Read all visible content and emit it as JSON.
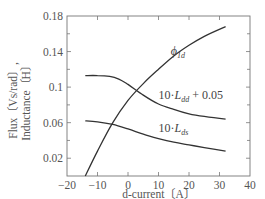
{
  "chart_data": {
    "type": "line",
    "title": "",
    "xlabel": "d-current〔A〕",
    "ylabel_lines": [
      "Flux〔Vs/rad〕,",
      "Inductance〔H〕"
    ],
    "xlim": [
      -20,
      40
    ],
    "ylim": [
      0,
      0.18
    ],
    "x_ticks": [
      -20,
      -10,
      0,
      10,
      20,
      30,
      40
    ],
    "x_tick_labels": [
      "−20",
      "−10",
      "0",
      "10",
      "20",
      "30",
      "40"
    ],
    "y_ticks": [
      0.02,
      0.06,
      0.1,
      0.14,
      0.18
    ],
    "y_tick_labels": [
      "0.02",
      "0.06",
      "0.1",
      "0.14",
      "0.18"
    ],
    "y_minor_ticks": [
      0.04,
      0.08,
      0.12,
      0.16
    ],
    "grid": false,
    "legend": "none (inline labels)",
    "series": [
      {
        "name": "phi_1d",
        "label_main": "ϕ",
        "label_sub": "1d",
        "x": [
          -14,
          -10,
          -5,
          0,
          5,
          10,
          15,
          20,
          25,
          32
        ],
        "y": [
          0.0,
          0.028,
          0.06,
          0.085,
          0.104,
          0.12,
          0.135,
          0.147,
          0.157,
          0.168
        ]
      },
      {
        "name": "10*L_dd+0.05",
        "label_prefix": "10·",
        "label_main": "L",
        "label_sub": "dd",
        "label_suffix": "+ 0.05",
        "x": [
          -14,
          -10,
          -6,
          -3,
          0,
          5,
          10,
          15,
          20,
          25,
          32
        ],
        "y": [
          0.113,
          0.113,
          0.112,
          0.109,
          0.103,
          0.091,
          0.081,
          0.075,
          0.07,
          0.067,
          0.064
        ]
      },
      {
        "name": "10*L_ds",
        "label_prefix": "10·",
        "label_main": "L",
        "label_sub": "ds",
        "label_suffix": "",
        "x": [
          -14,
          -10,
          -5,
          0,
          5,
          10,
          15,
          20,
          25,
          32
        ],
        "y": [
          0.062,
          0.061,
          0.058,
          0.053,
          0.047,
          0.042,
          0.038,
          0.035,
          0.032,
          0.028
        ]
      }
    ]
  }
}
